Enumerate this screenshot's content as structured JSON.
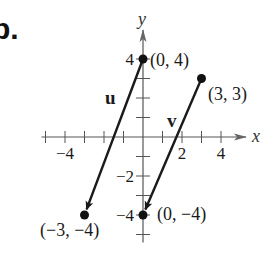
{
  "figure": {
    "part_label": "b.",
    "axes": {
      "x_label": "x",
      "y_label": "y",
      "origin_px": [
        143,
        137
      ],
      "unit_px": 19.5,
      "x_range": [
        -5,
        5
      ],
      "y_range": [
        -5,
        5
      ],
      "x_tick_labels": [
        {
          "value": -4,
          "text": "−4"
        },
        {
          "value": 2,
          "text": "2"
        },
        {
          "value": 4,
          "text": "4"
        }
      ],
      "y_tick_labels": [
        {
          "value": 4,
          "text": "4"
        },
        {
          "value": -2,
          "text": "−2"
        },
        {
          "value": -4,
          "text": "−4"
        }
      ]
    },
    "vectors": [
      {
        "name": "u",
        "label": "u",
        "start": [
          0,
          4
        ],
        "end": [
          -3,
          -4
        ],
        "start_label": "(0, 4)",
        "end_label": "(−3, −4)"
      },
      {
        "name": "v",
        "label": "v",
        "start": [
          3,
          3
        ],
        "end": [
          0,
          -4
        ],
        "start_label": "(3, 3)",
        "end_label": "(0, −4)"
      }
    ],
    "colors": {
      "ink": "#1a1a1a",
      "axis": "#555555",
      "background": "#ffffff"
    }
  }
}
